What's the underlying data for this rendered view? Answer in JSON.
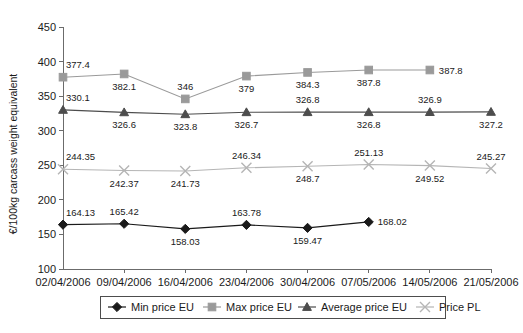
{
  "chart_data": {
    "type": "line",
    "title": "",
    "xlabel": "",
    "ylabel": "€/100kg carcass weight equivalent",
    "ylim": [
      100,
      450
    ],
    "yticks": [
      100,
      150,
      200,
      250,
      300,
      350,
      400,
      450
    ],
    "grid": false,
    "legend_position": "bottom",
    "categories": [
      "02/04/2006",
      "09/04/2006",
      "16/04/2006",
      "23/04/2006",
      "30/04/2006",
      "07/05/2006",
      "14/05/2006",
      "21/05/2006"
    ],
    "series": [
      {
        "name": "Min price EU",
        "marker": "diamond",
        "color": "#1a1a1a",
        "values": [
          164.13,
          165.42,
          158.03,
          163.78,
          159.47,
          168.02,
          null,
          null
        ],
        "labels": [
          "164.13",
          "165.42",
          "158.03",
          "163.78",
          "159.47",
          "168.02",
          "",
          ""
        ],
        "label_pos": [
          "above",
          "above",
          "below",
          "above",
          "below",
          "right",
          "",
          ""
        ]
      },
      {
        "name": "Max price EU",
        "marker": "square",
        "color": "#9a9a9a",
        "values": [
          377.4,
          382.1,
          346,
          379,
          384.3,
          387.8,
          387.8,
          null
        ],
        "labels": [
          "377.4",
          "382.1",
          "346",
          "379",
          "384.3",
          "387.8",
          "387.8",
          ""
        ],
        "label_pos": [
          "above",
          "below",
          "above",
          "below",
          "below",
          "below",
          "right",
          ""
        ]
      },
      {
        "name": "Average price EU",
        "marker": "triangle",
        "color": "#4d4d4d",
        "values": [
          330.1,
          326.6,
          323.8,
          326.7,
          326.8,
          326.8,
          326.9,
          327.2
        ],
        "labels": [
          "330.1",
          "326.6",
          "323.8",
          "326.7",
          "326.8",
          "326.8",
          "326.9",
          "327.2"
        ],
        "label_pos": [
          "above",
          "below",
          "below",
          "below",
          "above",
          "below",
          "above",
          "below"
        ]
      },
      {
        "name": "Price PL",
        "marker": "cross",
        "color": "#b5b5b5",
        "values": [
          244.35,
          242.37,
          241.73,
          246.34,
          248.7,
          251.13,
          249.52,
          245.27
        ],
        "labels": [
          "244.35",
          "242.37",
          "241.73",
          "246.34",
          "248.7",
          "251.13",
          "249.52",
          "245.27"
        ],
        "label_pos": [
          "above",
          "below",
          "below",
          "above",
          "below",
          "above",
          "below",
          "above"
        ]
      }
    ]
  },
  "legend": {
    "items": [
      {
        "label": "Min price EU"
      },
      {
        "label": "Max price EU"
      },
      {
        "label": "Average price EU"
      },
      {
        "label": "Price PL"
      }
    ]
  }
}
